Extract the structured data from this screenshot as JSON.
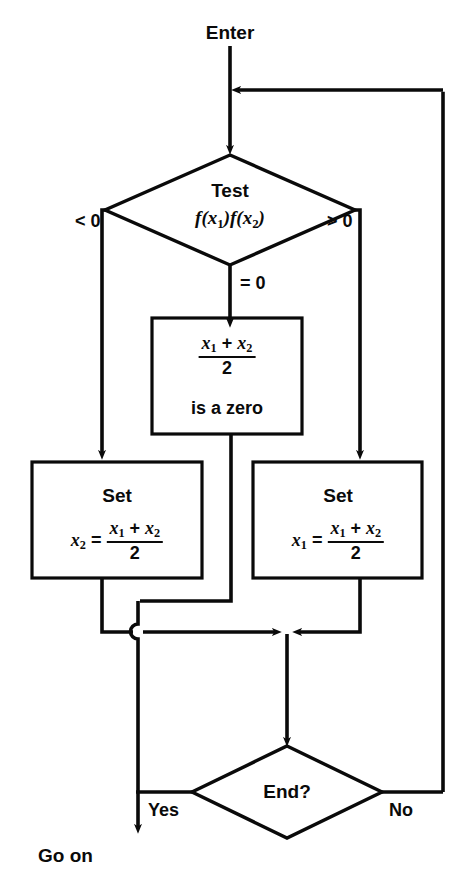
{
  "diagram": {
    "stroke_color": "#0a0a0a",
    "background": "#ffffff",
    "entry_label": "Enter",
    "exit_label": "Go on"
  },
  "nodes": {
    "test_decision": {
      "shape": "diamond",
      "line1": "Test",
      "line2_f": "f(",
      "line2_x1": "x",
      "line2_x1_sub": "1",
      "line2_mid": ")f(",
      "line2_x2": "x",
      "line2_x2_sub": "2",
      "line2_end": ")"
    },
    "zero_box": {
      "shape": "rect",
      "num_x1": "x",
      "num_x1_sub": "1",
      "num_plus": " + ",
      "num_x2": "x",
      "num_x2_sub": "2",
      "den": "2",
      "caption": "is a zero"
    },
    "set_left_box": {
      "shape": "rect",
      "title": "Set",
      "lhs_var": "x",
      "lhs_sub": "2",
      "equals": " = ",
      "num_x1": "x",
      "num_x1_sub": "1",
      "num_plus": " + ",
      "num_x2": "x",
      "num_x2_sub": "2",
      "den": "2"
    },
    "set_right_box": {
      "shape": "rect",
      "title": "Set",
      "lhs_var": "x",
      "lhs_sub": "1",
      "equals": " = ",
      "num_x1": "x",
      "num_x1_sub": "1",
      "num_plus": " + ",
      "num_x2": "x",
      "num_x2_sub": "2",
      "den": "2"
    },
    "end_decision": {
      "shape": "diamond",
      "label": "End?"
    }
  },
  "edge_labels": {
    "less_than_zero": "< 0",
    "greater_than_zero": "> 0",
    "equals_zero": "= 0",
    "yes": "Yes",
    "no": "No"
  }
}
